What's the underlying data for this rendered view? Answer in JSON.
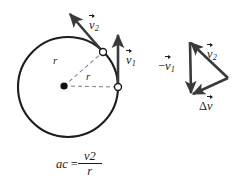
{
  "figure": {
    "type": "physics-diagram",
    "topic": "centripetal-acceleration",
    "colors": {
      "stroke": "#1c1c1c",
      "vector": "#3a3a3a",
      "dashed": "#8a8a8a",
      "background": "#ffffff",
      "marker_fill": "#ffffff"
    }
  },
  "circle_diagram": {
    "center_dot": "center-point",
    "circle": {
      "cx": 68,
      "cy": 87,
      "r": 50
    },
    "radius_label_upper": "r",
    "radius_label_lower": "r",
    "point_markers": [
      {
        "name": "position-2",
        "x": 103,
        "y": 52
      },
      {
        "name": "position-1",
        "x": 118,
        "y": 87
      }
    ],
    "vectors": [
      {
        "name": "v2",
        "label_base": "v",
        "label_sub": "2",
        "from": [
          103,
          52
        ],
        "to": [
          68,
          12
        ]
      },
      {
        "name": "v1",
        "label_base": "v",
        "label_sub": "1",
        "from": [
          118,
          87
        ],
        "to": [
          118,
          33
        ]
      }
    ]
  },
  "vector_triangle": {
    "vertices": {
      "top_left": [
        190,
        42
      ],
      "bottom_left": [
        191,
        95
      ],
      "right": [
        228,
        78
      ]
    },
    "vectors": [
      {
        "name": "minus-v1",
        "label_prefix": "−",
        "label_base": "v",
        "label_sub": "1",
        "from": [
          190,
          42
        ],
        "to": [
          191,
          95
        ]
      },
      {
        "name": "v2",
        "label_prefix": "",
        "label_base": "v",
        "label_sub": "2",
        "from": [
          228,
          78
        ],
        "to": [
          190,
          42
        ]
      },
      {
        "name": "delta-v",
        "label_prefix": "Δ",
        "label_base": "v",
        "label_sub": "",
        "from": [
          228,
          78
        ],
        "to": [
          191,
          95
        ]
      }
    ]
  },
  "equation": {
    "lhs_base": "a",
    "lhs_sub": "c",
    "equals": "=",
    "numerator_base": "v",
    "numerator_exp": "2",
    "denominator": "r"
  }
}
